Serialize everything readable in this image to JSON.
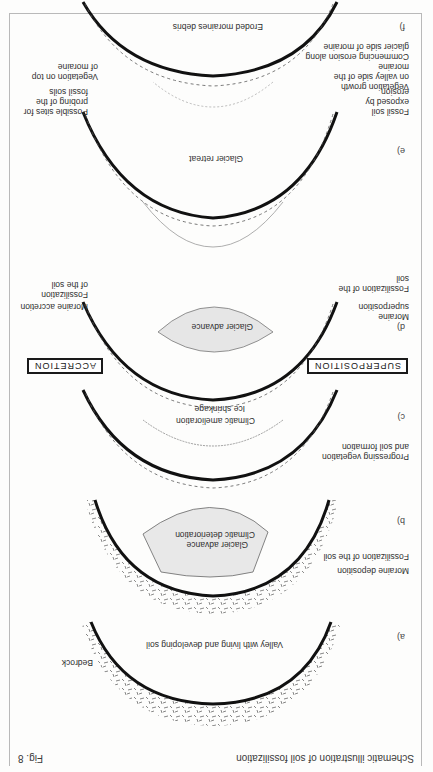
{
  "figure": {
    "caption": "Schematic illustration of soil fossilization",
    "number": "Fig. 8",
    "orientation": "rotated 180 degrees"
  },
  "panels": [
    {
      "id": "a)",
      "title": "Valley with living and developing soil",
      "labels": [
        "Bedrock"
      ]
    },
    {
      "id": "b)",
      "title_lines": [
        "Glacier advance",
        "Climatic deterioration"
      ],
      "labels": [
        "Moraine deposition",
        "Fossilization of the soil"
      ]
    },
    {
      "id": "c)",
      "title_lines": [
        "Ice shrinkage",
        "Climatic amelioration"
      ],
      "labels": [
        "Progressing vegetation",
        "and soil formation"
      ]
    },
    {
      "id": "d)",
      "title": "Glacier advance",
      "labels_left": [
        "Moraine",
        "superposition",
        "Fossilization of the",
        "soil"
      ],
      "labels_right": [
        "Moraine accretion",
        "Fossilization",
        "of the soil"
      ]
    },
    {
      "id": "e)",
      "title": "Glacier retreat",
      "labels_left": [
        "Vegetation growth",
        "on valley side of the",
        "moraine",
        "Commencing erosion along",
        "glacier side of moraine"
      ],
      "labels_right": [
        "Vegetation on top",
        "of moraine"
      ]
    },
    {
      "id": "f)",
      "title": "Eroded moraines debris",
      "labels_left": [
        "Fossil soil",
        "exposed by",
        "erosion"
      ],
      "labels_right": [
        "Possible sites for",
        "probing of the",
        "fossil soils"
      ]
    }
  ],
  "boxes": {
    "superposition": "SUPERPOSITION",
    "accretion": "ACCRETION"
  }
}
